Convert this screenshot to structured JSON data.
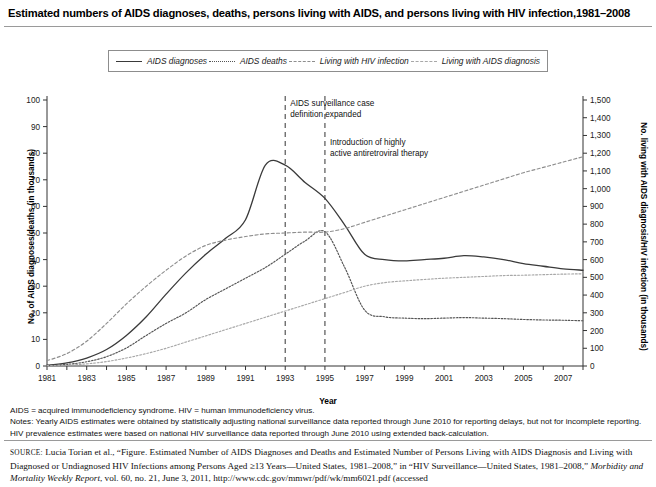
{
  "title": "Estimated numbers of AIDS diagnoses, deaths, persons living with AIDS, and persons living with HIV infection,1981–2008",
  "axis": {
    "left_title": "No. of AIDS diagnoses/deaths (in thousands)",
    "right_title": "No. living with AIDS diagnosis/HIV infection (in thousands)",
    "x_title": "Year"
  },
  "legend": [
    {
      "label": "AIDS diagnoses",
      "style": "solid",
      "color": "#3a3a3a"
    },
    {
      "label": "AIDS deaths",
      "style": "dotted",
      "color": "#555555"
    },
    {
      "label": "Living with HIV infection",
      "style": "dashed",
      "color": "#8e8e8e"
    },
    {
      "label": "Living with AIDS diagnosis",
      "style": "dash-dot",
      "color": "#a8a8a8"
    }
  ],
  "annotations": [
    {
      "text_line1": "AIDS surveillance case",
      "text_line2": "definition expanded",
      "year": 1993
    },
    {
      "text_line1": "Introduction of highly",
      "text_line2": "active antiretroviral therapy",
      "year": 1995
    }
  ],
  "notes": [
    "AIDS = acquired immunodeficiency syndrome. HIV = human immunodeficiency virus.",
    "Notes: Yearly AIDS estimates were obtained by statistically adjusting national surveillance data reported through June 2010 for reporting delays, but not for incomplete reporting.",
    "HIV prevalence estimates were based on national HIV surveillance data reported through June 2010 using extended back-calculation."
  ],
  "source": {
    "keyword": "SOURCE:",
    "line1": " Lucia Torian et al., “Figure. Estimated Number of AIDS Diagnoses and Deaths and Estimated Number of Persons Living with AIDS Diagnosis",
    "line2": "and Living with Diagnosed or Undiagnosed HIV Infections among Persons Aged ≥13 Years—United States, 1981–2008,” in “HIV Surveillance—United",
    "line3_pre": "States, 1981–2008,” ",
    "line3_italic": "Morbidity and Mortality Weekly Report",
    "line3_post": ", vol. 60, no. 21, June 3, 2011, http://www.cdc.gov/mmwr/pdf/wk/mm6021.pdf (accessed"
  },
  "chart_data": {
    "type": "line",
    "title": "Estimated numbers of AIDS diagnoses, deaths, persons living with AIDS, and persons living with HIV infection,1981–2008",
    "xlabel": "Year",
    "ylabel": "No. of AIDS diagnoses/deaths (in thousands)",
    "y2label": "No. living with AIDS diagnosis/HIV infection (in thousands)",
    "xlim": [
      1981,
      2008
    ],
    "ylim": [
      0,
      100
    ],
    "y2lim": [
      0,
      1500
    ],
    "grid": false,
    "legend_position": "top",
    "x_tick_labels": [
      "1981",
      "1983",
      "1985",
      "1987",
      "1989",
      "1991",
      "1993",
      "1995",
      "1997",
      "1999",
      "2001",
      "2003",
      "2005",
      "2007"
    ],
    "y_tick_labels": [
      "0",
      "10",
      "20",
      "30",
      "40",
      "50",
      "60",
      "70",
      "80",
      "90",
      "100"
    ],
    "y2_tick_labels": [
      "0",
      "100",
      "200",
      "300",
      "400",
      "500",
      "600",
      "700",
      "800",
      "900",
      "1,000",
      "1,100",
      "1,200",
      "1,300",
      "1,400",
      "1,500"
    ],
    "x": [
      1981,
      1982,
      1983,
      1984,
      1985,
      1986,
      1987,
      1988,
      1989,
      1990,
      1991,
      1992,
      1993,
      1994,
      1995,
      1996,
      1997,
      1998,
      1999,
      2000,
      2001,
      2002,
      2003,
      2004,
      2005,
      2006,
      2007,
      2008
    ],
    "series": [
      {
        "name": "AIDS diagnoses",
        "axis": "left",
        "units": "thousands",
        "style": "solid",
        "values": [
          0.3,
          1.2,
          3.0,
          6.2,
          11.5,
          18.5,
          27.0,
          35.0,
          42.0,
          48.0,
          55.0,
          75.5,
          75.5,
          69.0,
          63.0,
          53.0,
          42.0,
          40.0,
          39.5,
          40.0,
          40.5,
          41.5,
          41.0,
          40.0,
          38.5,
          37.5,
          36.5,
          36.0
        ]
      },
      {
        "name": "AIDS deaths",
        "axis": "left",
        "units": "thousands",
        "style": "dotted",
        "values": [
          0.2,
          0.6,
          1.6,
          3.5,
          6.8,
          11.5,
          16.0,
          20.0,
          25.0,
          29.0,
          33.0,
          37.0,
          42.0,
          47.0,
          50.5,
          37.0,
          21.0,
          18.5,
          18.0,
          17.8,
          18.0,
          18.2,
          18.0,
          17.8,
          17.5,
          17.3,
          17.2,
          17.0
        ]
      },
      {
        "name": "Living with HIV infection",
        "axis": "right",
        "units": "thousands",
        "style": "dashed",
        "values": [
          30,
          70,
          140,
          240,
          350,
          450,
          540,
          620,
          680,
          710,
          730,
          745,
          750,
          755,
          755,
          775,
          810,
          845,
          880,
          915,
          950,
          985,
          1020,
          1055,
          1090,
          1120,
          1150,
          1180
        ]
      },
      {
        "name": "Living with AIDS diagnosis",
        "axis": "right",
        "units": "thousands",
        "style": "dash-dot",
        "values": [
          2,
          5,
          12,
          25,
          45,
          70,
          100,
          135,
          170,
          205,
          240,
          275,
          310,
          345,
          380,
          415,
          450,
          470,
          480,
          488,
          495,
          500,
          505,
          510,
          512,
          515,
          518,
          520
        ]
      }
    ]
  }
}
